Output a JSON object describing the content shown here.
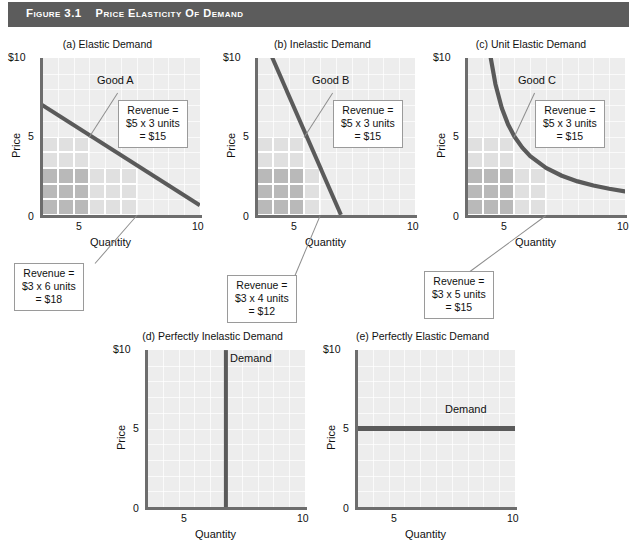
{
  "header": {
    "figure_number": "Figure 3.1",
    "title": "Price Elasticity of Demand",
    "bar_color": "#5c5c5c"
  },
  "axes_common": {
    "ylabel": "Price",
    "xlabel": "Quantity",
    "y_ticks": [
      "$10",
      "5",
      "0"
    ],
    "x_ticks": [
      "5",
      "10"
    ],
    "x_origin_tick": "0"
  },
  "style": {
    "plot_background": "#ededed",
    "gridline_color": "#ffffff",
    "axis_color": "#6d6d6d",
    "demand_line_color": "#5a5a5a",
    "shade_light": "#e0e0e0",
    "shade_medium": "#d2d2d2",
    "shade_dark": "#b9b9b9",
    "callout_border": "#9a9a9a"
  },
  "panels": [
    {
      "id": "a",
      "title": "(a) Elastic Demand",
      "good_label": "Good A",
      "callout_inside": {
        "l1": "Revenue =",
        "l2": "$5 x 3 units",
        "l3": "= $15"
      },
      "callout_below": {
        "l1": "Revenue =",
        "l2": "$3 x 6 units",
        "l3": "= $18"
      }
    },
    {
      "id": "b",
      "title": "(b) Inelastic Demand",
      "good_label": "Good B",
      "callout_inside": {
        "l1": "Revenue =",
        "l2": "$5 x 3 units",
        "l3": "= $15"
      },
      "callout_below": {
        "l1": "Revenue =",
        "l2": "$3 x 4 units",
        "l3": "= $12"
      }
    },
    {
      "id": "c",
      "title": "(c) Unit Elastic Demand",
      "good_label": "Good C",
      "callout_inside": {
        "l1": "Revenue =",
        "l2": "$5 x 3 units",
        "l3": "= $15"
      },
      "callout_below": {
        "l1": "Revenue =",
        "l2": "$3 x 5 units",
        "l3": "= $15"
      }
    },
    {
      "id": "d",
      "title": "(d) Perfectly Inelastic Demand",
      "curve_label": "Demand"
    },
    {
      "id": "e",
      "title": "(e) Perfectly Elastic Demand",
      "curve_label": "Demand"
    }
  ],
  "chart_data": [
    {
      "type": "line",
      "id": "a",
      "title": "(a) Elastic Demand",
      "subtitle": "Good A",
      "xlabel": "Quantity",
      "ylabel": "Price",
      "xlim": [
        0,
        10
      ],
      "ylim": [
        0,
        10
      ],
      "xticks": [
        0,
        5,
        10
      ],
      "yticks": [
        0,
        5,
        10
      ],
      "ytick_labels": [
        "0",
        "5",
        "$10"
      ],
      "grid": true,
      "series": [
        {
          "name": "Demand (elastic)",
          "x": [
            0,
            10
          ],
          "y": [
            7.0,
            0.6
          ]
        }
      ],
      "annotations": [
        {
          "kind": "revenue_rectangle",
          "price": 5,
          "quantity": 3,
          "revenue": 15,
          "label": "Revenue = $5 x 3 units = $15"
        },
        {
          "kind": "revenue_rectangle",
          "price": 3,
          "quantity": 6,
          "revenue": 18,
          "label": "Revenue = $3 x 6 units = $18"
        }
      ]
    },
    {
      "type": "line",
      "id": "b",
      "title": "(b) Inelastic Demand",
      "subtitle": "Good B",
      "xlabel": "Quantity",
      "ylabel": "Price",
      "xlim": [
        0,
        10
      ],
      "ylim": [
        0,
        10
      ],
      "xticks": [
        0,
        5,
        10
      ],
      "yticks": [
        0,
        5,
        10
      ],
      "ytick_labels": [
        "0",
        "5",
        "$10"
      ],
      "grid": true,
      "series": [
        {
          "name": "Demand (inelastic)",
          "x": [
            0.7,
            5.3
          ],
          "y": [
            10.6,
            0.0
          ]
        }
      ],
      "annotations": [
        {
          "kind": "revenue_rectangle",
          "price": 5,
          "quantity": 3,
          "revenue": 15,
          "label": "Revenue = $5 x 3 units = $15"
        },
        {
          "kind": "revenue_rectangle",
          "price": 3,
          "quantity": 4,
          "revenue": 12,
          "label": "Revenue = $3 x 4 units = $12"
        }
      ]
    },
    {
      "type": "line",
      "id": "c",
      "title": "(c) Unit Elastic Demand",
      "subtitle": "Good C",
      "xlabel": "Quantity",
      "ylabel": "Price",
      "xlim": [
        0,
        10
      ],
      "ylim": [
        0,
        10
      ],
      "xticks": [
        0,
        5,
        10
      ],
      "yticks": [
        0,
        5,
        10
      ],
      "ytick_labels": [
        "0",
        "5",
        "$10"
      ],
      "grid": true,
      "series": [
        {
          "name": "Demand (unit elastic, xy = 15)",
          "x": [
            1.45,
            1.8,
            2.2,
            2.6,
            3.0,
            3.5,
            4.0,
            5.0,
            6.0,
            7.0,
            8.0,
            9.0,
            10.0
          ],
          "y": [
            10.3,
            8.33,
            6.82,
            5.77,
            5.0,
            4.29,
            3.75,
            3.0,
            2.5,
            2.14,
            1.88,
            1.67,
            1.5
          ]
        }
      ],
      "annotations": [
        {
          "kind": "revenue_rectangle",
          "price": 5,
          "quantity": 3,
          "revenue": 15,
          "label": "Revenue = $5 x 3 units = $15"
        },
        {
          "kind": "revenue_rectangle",
          "price": 3,
          "quantity": 5,
          "revenue": 15,
          "label": "Revenue = $3 x 5 units = $15"
        }
      ]
    },
    {
      "type": "line",
      "id": "d",
      "title": "(d) Perfectly Inelastic Demand",
      "xlabel": "Quantity",
      "ylabel": "Price",
      "xlim": [
        0,
        10
      ],
      "ylim": [
        0,
        10
      ],
      "xticks": [
        0,
        5,
        10
      ],
      "yticks": [
        0,
        5,
        10
      ],
      "ytick_labels": [
        "0",
        "5",
        "$10"
      ],
      "grid": true,
      "series": [
        {
          "name": "Demand",
          "x": [
            5,
            5
          ],
          "y": [
            0,
            10
          ]
        }
      ]
    },
    {
      "type": "line",
      "id": "e",
      "title": "(e) Perfectly Elastic Demand",
      "xlabel": "Quantity",
      "ylabel": "Price",
      "xlim": [
        0,
        10
      ],
      "ylim": [
        0,
        10
      ],
      "xticks": [
        0,
        5,
        10
      ],
      "yticks": [
        0,
        5,
        10
      ],
      "ytick_labels": [
        "0",
        "5",
        "$10"
      ],
      "grid": true,
      "series": [
        {
          "name": "Demand",
          "x": [
            0,
            10
          ],
          "y": [
            5,
            5
          ]
        }
      ]
    }
  ]
}
